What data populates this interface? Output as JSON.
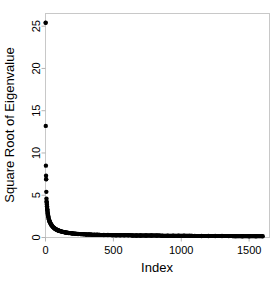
{
  "figure": {
    "title": "",
    "background_color": "#ffffff",
    "point_color": "#000000",
    "frame_color": "#c8c8c8"
  },
  "axes": {
    "x_title": "Index",
    "y_title": "Square Root of Eigenvalue",
    "x_ticks": [
      "0",
      "500",
      "1000",
      "1500"
    ],
    "y_ticks": [
      "0",
      "5",
      "10",
      "15",
      "20",
      "25"
    ]
  },
  "chart_data": {
    "type": "scatter",
    "title": "",
    "xlabel": "Index",
    "ylabel": "Square Root of Eigenvalue",
    "xlim": [
      0,
      1650
    ],
    "ylim": [
      0,
      26.5
    ],
    "xticks": [
      0,
      500,
      1000,
      1500
    ],
    "yticks": [
      0,
      5,
      10,
      15,
      20,
      25
    ],
    "grid": false,
    "legend": "none",
    "marker": "filled-circle",
    "series": [
      {
        "name": "Square root of eigenvalue",
        "x": [
          1,
          2,
          3,
          4,
          5,
          6,
          7,
          8,
          9,
          10,
          11,
          12,
          13,
          14,
          15,
          16,
          17,
          18,
          19,
          20,
          22,
          24,
          26,
          28,
          30,
          33,
          36,
          39,
          42,
          45,
          50,
          55,
          60,
          65,
          70,
          75,
          80,
          85,
          90,
          95,
          100,
          110,
          120,
          130,
          140,
          150,
          160,
          170,
          180,
          190,
          200,
          220,
          240,
          260,
          280,
          300,
          320,
          340,
          360,
          380,
          400,
          430,
          460,
          490,
          520,
          550,
          580,
          610,
          640,
          670,
          700,
          740,
          780,
          820,
          860,
          900,
          940,
          980,
          1020,
          1060,
          1100,
          1150,
          1200,
          1250,
          1300,
          1350,
          1400,
          1450,
          1500,
          1550,
          1600
        ],
        "y": [
          25.4,
          13.2,
          8.5,
          7.3,
          6.9,
          5.4,
          4.6,
          4.3,
          4.1,
          3.9,
          3.7,
          3.5,
          3.35,
          3.2,
          3.05,
          2.9,
          2.8,
          2.7,
          2.6,
          2.5,
          2.35,
          2.2,
          2.1,
          2.0,
          1.9,
          1.8,
          1.7,
          1.6,
          1.52,
          1.45,
          1.34,
          1.25,
          1.17,
          1.1,
          1.04,
          0.99,
          0.94,
          0.9,
          0.86,
          0.83,
          0.8,
          0.74,
          0.7,
          0.66,
          0.62,
          0.59,
          0.56,
          0.54,
          0.52,
          0.5,
          0.48,
          0.45,
          0.42,
          0.4,
          0.38,
          0.36,
          0.35,
          0.34,
          0.33,
          0.32,
          0.31,
          0.3,
          0.29,
          0.28,
          0.27,
          0.265,
          0.26,
          0.255,
          0.25,
          0.245,
          0.24,
          0.235,
          0.23,
          0.225,
          0.22,
          0.215,
          0.21,
          0.205,
          0.2,
          0.195,
          0.19,
          0.185,
          0.18,
          0.175,
          0.17,
          0.165,
          0.16,
          0.155,
          0.15,
          0.145,
          0.14
        ],
        "color": "#000000"
      }
    ]
  }
}
